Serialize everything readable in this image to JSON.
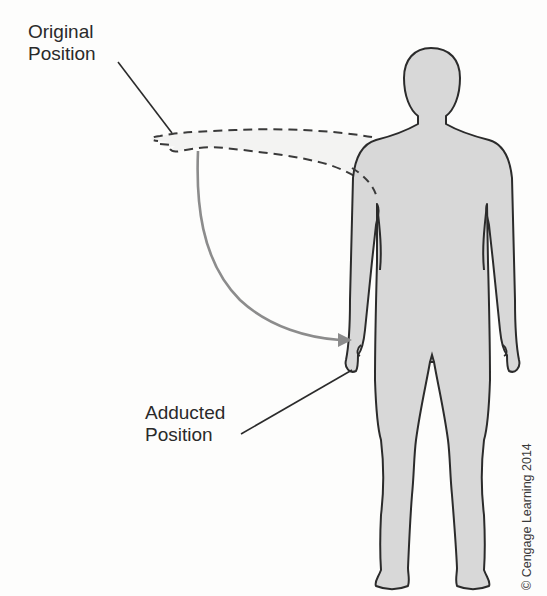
{
  "figure": {
    "labels": {
      "original_line1": "Original",
      "original_line2": "Position",
      "adducted_line1": "Adducted",
      "adducted_line2": "Position"
    },
    "copyright": "© Cengage Learning 2014",
    "colors": {
      "body_fill": "#d8d8d8",
      "outline": "#2b2b2b",
      "dashed_arm": "#3a3a3a",
      "motion_arrow": "#8c8c8c",
      "background": "#fdfdfc"
    }
  }
}
